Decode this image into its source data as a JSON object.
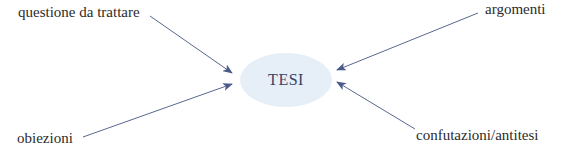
{
  "diagram": {
    "center": {
      "label": "TESI",
      "fill": "#e6eef8",
      "text_color": "#3a4466"
    },
    "nodes": [
      {
        "id": "questione",
        "label": "questione da trattare",
        "position": "top-left"
      },
      {
        "id": "argomenti",
        "label": "argomenti",
        "position": "top-right"
      },
      {
        "id": "obiezioni",
        "label": "obiezioni",
        "position": "bottom-left"
      },
      {
        "id": "confutazioni",
        "label": "confutazioni/antitesi",
        "position": "bottom-right"
      }
    ],
    "edges": [
      {
        "from": "questione",
        "to": "TESI"
      },
      {
        "from": "argomenti",
        "to": "TESI"
      },
      {
        "from": "obiezioni",
        "to": "TESI"
      },
      {
        "from": "confutazioni",
        "to": "TESI"
      }
    ],
    "arrow_color": "#4a5a8a"
  }
}
